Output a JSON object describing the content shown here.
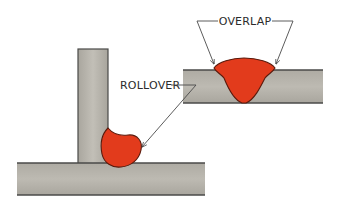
{
  "diagram": {
    "labels": {
      "overlap": "OVERLAP",
      "rollover": "ROLLOVER"
    },
    "colors": {
      "plate_fill": "#b4b1a9",
      "plate_edge": "#4a4a48",
      "weld_fill": "#e23b1c",
      "weld_edge": "#5a1a0c",
      "leader_line": "#4a4a4a",
      "background": "#ffffff"
    }
  }
}
